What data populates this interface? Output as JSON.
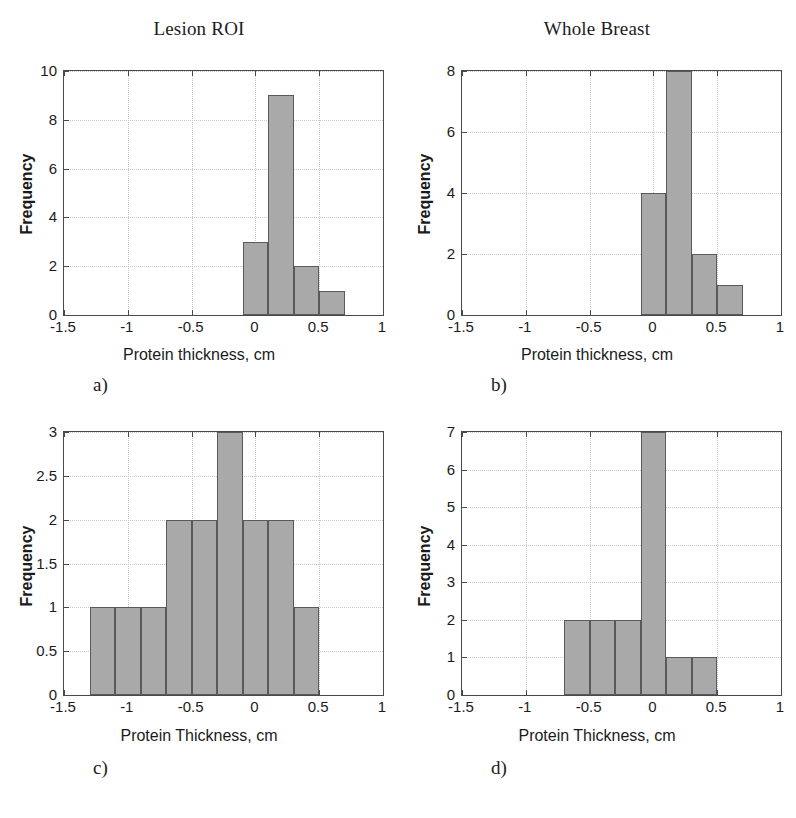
{
  "figure": {
    "column_titles": [
      {
        "label": "Lesion ROI"
      },
      {
        "label": "Whole Breast"
      }
    ]
  },
  "panels": {
    "a": {
      "letter": "a)",
      "xlabel": "Protein thickness, cm",
      "ylabel": "Frequency",
      "xticks": [
        "-1.5",
        "-1",
        "-0.5",
        "0",
        "0.5",
        "1"
      ],
      "yticks": [
        "0",
        "2",
        "4",
        "6",
        "8",
        "10"
      ]
    },
    "b": {
      "letter": "b)",
      "xlabel": "Protein thickness, cm",
      "ylabel": "Frequency",
      "xticks": [
        "-1.5",
        "-1",
        "-0.5",
        "0",
        "0.5",
        "1"
      ],
      "yticks": [
        "0",
        "2",
        "4",
        "6",
        "8"
      ]
    },
    "c": {
      "letter": "c)",
      "xlabel": "Protein Thickness, cm",
      "ylabel": "Frequency",
      "xticks": [
        "-1.5",
        "-1",
        "-0.5",
        "0",
        "0.5",
        "1"
      ],
      "yticks": [
        "0",
        "0.5",
        "1",
        "1.5",
        "2",
        "2.5",
        "3"
      ]
    },
    "d": {
      "letter": "d)",
      "xlabel": "Protein Thickness, cm",
      "ylabel": "Frequency",
      "xticks": [
        "-1.5",
        "-1",
        "-0.5",
        "0",
        "0.5",
        "1"
      ],
      "yticks": [
        "0",
        "1",
        "2",
        "3",
        "4",
        "5",
        "6",
        "7"
      ]
    }
  },
  "colors": {
    "bar_fill": "#a9a9a9",
    "bar_edge": "#5a5a5a",
    "axis": "#4a4a4a",
    "grid": "#c9c9c9",
    "text": "#1b1b1b",
    "background": "#ffffff"
  },
  "chart_data": [
    {
      "id": "a",
      "type": "bar",
      "title": "Lesion ROI",
      "panel_label": "a)",
      "xlabel": "Protein thickness, cm",
      "ylabel": "Frequency",
      "xlim": [
        -1.5,
        1
      ],
      "ylim": [
        0,
        10
      ],
      "xticks": [
        -1.5,
        -1,
        -0.5,
        0,
        0.5,
        1
      ],
      "yticks": [
        0,
        2,
        4,
        6,
        8,
        10
      ],
      "grid": true,
      "legend": null,
      "bin_width": 0.2,
      "bin_edges": [
        -0.1,
        0.1,
        0.3,
        0.5,
        0.7
      ],
      "bin_centers": [
        0.0,
        0.2,
        0.4,
        0.6
      ],
      "values": [
        3,
        9,
        2,
        1
      ]
    },
    {
      "id": "b",
      "type": "bar",
      "title": "Whole Breast",
      "panel_label": "b)",
      "xlabel": "Protein thickness, cm",
      "ylabel": "Frequency",
      "xlim": [
        -1.5,
        1
      ],
      "ylim": [
        0,
        8
      ],
      "xticks": [
        -1.5,
        -1,
        -0.5,
        0,
        0.5,
        1
      ],
      "yticks": [
        0,
        2,
        4,
        6,
        8
      ],
      "grid": true,
      "legend": null,
      "bin_width": 0.2,
      "bin_edges": [
        -0.1,
        0.1,
        0.3,
        0.5,
        0.7
      ],
      "bin_centers": [
        0.0,
        0.2,
        0.4,
        0.6
      ],
      "values": [
        4,
        8,
        2,
        1
      ]
    },
    {
      "id": "c",
      "type": "bar",
      "title": "",
      "panel_label": "c)",
      "xlabel": "Protein Thickness, cm",
      "ylabel": "Frequency",
      "xlim": [
        -1.5,
        1
      ],
      "ylim": [
        0,
        3
      ],
      "xticks": [
        -1.5,
        -1,
        -0.5,
        0,
        0.5,
        1
      ],
      "yticks": [
        0,
        0.5,
        1,
        1.5,
        2,
        2.5,
        3
      ],
      "grid": true,
      "legend": null,
      "bin_width": 0.2,
      "bin_edges": [
        -1.3,
        -1.1,
        -0.9,
        -0.7,
        -0.5,
        -0.3,
        -0.1,
        0.1,
        0.3,
        0.5
      ],
      "bin_centers": [
        -1.2,
        -1.0,
        -0.8,
        -0.6,
        -0.4,
        -0.2,
        0.0,
        0.2,
        0.4
      ],
      "values": [
        1,
        1,
        1,
        2,
        2,
        3,
        2,
        2,
        1
      ]
    },
    {
      "id": "d",
      "type": "bar",
      "title": "",
      "panel_label": "d)",
      "xlabel": "Protein Thickness, cm",
      "ylabel": "Frequency",
      "xlim": [
        -1.5,
        1
      ],
      "ylim": [
        0,
        7
      ],
      "xticks": [
        -1.5,
        -1,
        -0.5,
        0,
        0.5,
        1
      ],
      "yticks": [
        0,
        1,
        2,
        3,
        4,
        5,
        6,
        7
      ],
      "grid": true,
      "legend": null,
      "bin_width": 0.2,
      "bin_edges": [
        -0.7,
        -0.5,
        -0.3,
        -0.1,
        0.1,
        0.3,
        0.5
      ],
      "bin_centers": [
        -0.6,
        -0.4,
        -0.2,
        0.0,
        0.2,
        0.4
      ],
      "values": [
        2,
        2,
        2,
        7,
        1,
        1
      ]
    }
  ]
}
